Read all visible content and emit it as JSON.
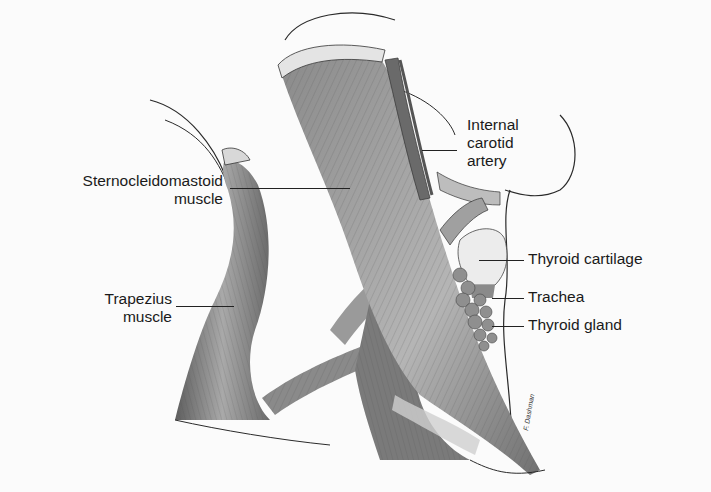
{
  "figure": {
    "labels": {
      "sternocleidomastoid": [
        "Sternocleidomastoid",
        "muscle"
      ],
      "trapezius": [
        "Trapezius",
        "muscle"
      ],
      "internal_carotid": [
        "Internal",
        "carotid",
        "artery"
      ],
      "thyroid_cartilage": "Thyroid cartilage",
      "trachea": "Trachea",
      "thyroid_gland": "Thyroid gland"
    },
    "signature": "F. Dashman"
  },
  "colors": {
    "background": "#fbfbfb",
    "muscle_dark": "#6e6e6e",
    "muscle_light": "#b8b8b8",
    "outline": "#2a2a2a"
  }
}
